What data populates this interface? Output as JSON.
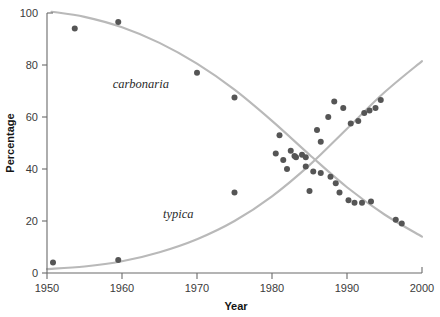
{
  "chart_data": {
    "type": "scatter",
    "title": "",
    "xlabel": "Year",
    "ylabel": "Percentage",
    "xlim": [
      1950,
      2000
    ],
    "ylim": [
      0,
      100
    ],
    "xticks": [
      1950,
      1960,
      1970,
      1980,
      1990,
      2000
    ],
    "yticks": [
      0,
      20,
      40,
      60,
      80,
      100
    ],
    "xtick_labels": [
      "1950",
      "1960",
      "1970",
      "1980",
      "1990",
      "2000"
    ],
    "ytick_labels": [
      "0",
      "20",
      "40",
      "60",
      "80",
      "100"
    ],
    "grid": false,
    "legend": "inline-annotations",
    "annotations": [
      {
        "text": "carbonaria",
        "x": 1962.5,
        "y": 71
      },
      {
        "text": "typica",
        "x": 1967.5,
        "y": 21
      }
    ],
    "point_color": "#555555",
    "curve_color": "#b9b9b9",
    "axis_color": "#6b6b6b",
    "series": [
      {
        "name": "carbonaria",
        "marker": "circle",
        "color": "#555555",
        "points": [
          {
            "x": 1953.7,
            "y": 94.0
          },
          {
            "x": 1959.5,
            "y": 96.5
          },
          {
            "x": 1970.0,
            "y": 77.0
          },
          {
            "x": 1975.0,
            "y": 67.5
          },
          {
            "x": 1981.0,
            "y": 53.0
          },
          {
            "x": 1982.5,
            "y": 47.0
          },
          {
            "x": 1983.2,
            "y": 44.5
          },
          {
            "x": 1984.0,
            "y": 45.5
          },
          {
            "x": 1984.5,
            "y": 41.0
          },
          {
            "x": 1985.5,
            "y": 39.0
          },
          {
            "x": 1986.5,
            "y": 38.5
          },
          {
            "x": 1987.8,
            "y": 37.0
          },
          {
            "x": 1988.5,
            "y": 34.5
          },
          {
            "x": 1989.0,
            "y": 31.0
          },
          {
            "x": 1990.2,
            "y": 28.0
          },
          {
            "x": 1991.0,
            "y": 27.0
          },
          {
            "x": 1992.0,
            "y": 27.0
          },
          {
            "x": 1993.2,
            "y": 27.5
          },
          {
            "x": 1985.0,
            "y": 31.5
          },
          {
            "x": 1975.0,
            "y": 31.0
          },
          {
            "x": 1996.5,
            "y": 20.5
          },
          {
            "x": 1997.3,
            "y": 19.0
          }
        ]
      },
      {
        "name": "typica",
        "marker": "circle",
        "color": "#555555",
        "points": [
          {
            "x": 1950.8,
            "y": 4.0
          },
          {
            "x": 1959.5,
            "y": 5.0
          },
          {
            "x": 1982.0,
            "y": 40.0
          },
          {
            "x": 1983.0,
            "y": 45.0
          },
          {
            "x": 1984.5,
            "y": 44.5
          },
          {
            "x": 1986.5,
            "y": 50.5
          },
          {
            "x": 1987.5,
            "y": 60.0
          },
          {
            "x": 1988.3,
            "y": 66.0
          },
          {
            "x": 1989.5,
            "y": 63.5
          },
          {
            "x": 1990.5,
            "y": 57.5
          },
          {
            "x": 1991.5,
            "y": 58.5
          },
          {
            "x": 1992.3,
            "y": 61.5
          },
          {
            "x": 1993.0,
            "y": 62.5
          },
          {
            "x": 1993.8,
            "y": 63.5
          },
          {
            "x": 1994.5,
            "y": 66.5
          },
          {
            "x": 1986.0,
            "y": 55.0
          },
          {
            "x": 1980.5,
            "y": 46.0
          },
          {
            "x": 1981.5,
            "y": 43.5
          }
        ]
      }
    ],
    "curves": [
      {
        "name": "carbonaria-fit",
        "color": "#b9b9b9",
        "points": [
          {
            "x": 1950.6,
            "y": 100.5
          },
          {
            "x": 1955,
            "y": 98.5
          },
          {
            "x": 1960,
            "y": 94.5
          },
          {
            "x": 1965,
            "y": 88.5
          },
          {
            "x": 1970,
            "y": 80.5
          },
          {
            "x": 1975,
            "y": 70.5
          },
          {
            "x": 1980,
            "y": 58.5
          },
          {
            "x": 1985,
            "y": 45.5
          },
          {
            "x": 1990,
            "y": 33.0
          },
          {
            "x": 1995,
            "y": 22.5
          },
          {
            "x": 2000,
            "y": 14.0
          }
        ]
      },
      {
        "name": "typica-fit",
        "color": "#b9b9b9",
        "points": [
          {
            "x": 1950,
            "y": 1.5
          },
          {
            "x": 1955,
            "y": 2.5
          },
          {
            "x": 1960,
            "y": 4.5
          },
          {
            "x": 1965,
            "y": 8.0
          },
          {
            "x": 1970,
            "y": 13.0
          },
          {
            "x": 1975,
            "y": 20.0
          },
          {
            "x": 1980,
            "y": 29.5
          },
          {
            "x": 1985,
            "y": 41.5
          },
          {
            "x": 1990,
            "y": 55.5
          },
          {
            "x": 1995,
            "y": 69.5
          },
          {
            "x": 2000,
            "y": 81.5
          }
        ]
      }
    ]
  }
}
